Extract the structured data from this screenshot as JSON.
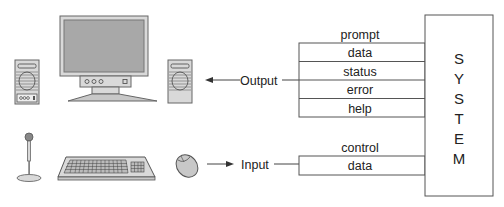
{
  "diagram": {
    "system": {
      "label": "SYSTEM",
      "letters": [
        "S",
        "Y",
        "S",
        "T",
        "E",
        "M"
      ]
    },
    "output": {
      "label": "Output",
      "header": "prompt",
      "rows": [
        "data",
        "status",
        "error",
        "help"
      ]
    },
    "input": {
      "label": "Input",
      "header": "control",
      "rows": [
        "data"
      ]
    },
    "devices": {
      "output": [
        "left-speaker",
        "monitor",
        "right-speaker"
      ],
      "input": [
        "microphone",
        "keyboard",
        "mouse"
      ]
    },
    "colors": {
      "line": "#555555",
      "device_fill": "#d9d9d9",
      "screen_fill": "#a8a8a8",
      "text": "#222222"
    }
  }
}
